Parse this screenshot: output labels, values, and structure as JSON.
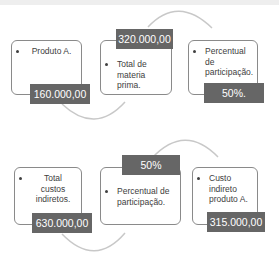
{
  "colors": {
    "label_bg": "#666666",
    "label_text": "#ffffff",
    "box_border": "#8a8a8a",
    "arc": "#c8c8c8",
    "text": "#404040"
  },
  "flow1": {
    "steps": [
      {
        "text": "Produto A.",
        "value": "160.000,00"
      },
      {
        "text": "Total de materia prima.",
        "value": "320.000,00"
      },
      {
        "text": "Percentual de participação.",
        "value": "50%."
      }
    ]
  },
  "flow2": {
    "steps": [
      {
        "text": "Total custos indiretos.",
        "value": "630.000,00"
      },
      {
        "text": "Percentual de participação.",
        "value": "50%"
      },
      {
        "text": "Custo indireto produto A.",
        "value": "315.000,00"
      }
    ]
  }
}
